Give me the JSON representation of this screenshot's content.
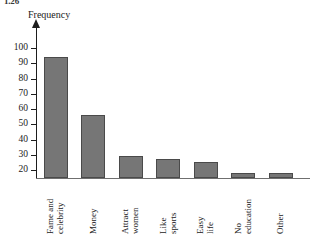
{
  "figure": {
    "number_label": "1.26",
    "y_axis_title": "Frequency"
  },
  "chart_data": {
    "type": "bar",
    "title": "",
    "subtitle": "",
    "xlabel": "",
    "ylabel": "Frequency",
    "categories": [
      "Fame and\ncelebrity",
      "Money",
      "Attract\nwomen",
      "Like\nsports",
      "Easy\nlife",
      "No\neducation",
      "Other"
    ],
    "category_lines": [
      [
        "Fame and",
        "celebrity"
      ],
      [
        "Money"
      ],
      [
        "Attract",
        "women"
      ],
      [
        "Like",
        "sports"
      ],
      [
        "Easy",
        "life"
      ],
      [
        "No",
        "education"
      ],
      [
        "Other"
      ]
    ],
    "values": [
      94,
      56,
      29,
      27,
      25,
      18,
      18
    ],
    "ylim": [
      10,
      103
    ],
    "yticks": [
      20,
      30,
      40,
      50,
      60,
      70,
      80,
      90,
      100
    ],
    "ytick_labels": [
      "20",
      "30",
      "40",
      "50",
      "60",
      "70",
      "80",
      "90",
      "100"
    ],
    "grid": false,
    "legend": false,
    "bar_color": "#767676",
    "bar_edge_color": "#4a4a4a",
    "axis_color": "#1d1d1d",
    "label_rotation": -90
  }
}
